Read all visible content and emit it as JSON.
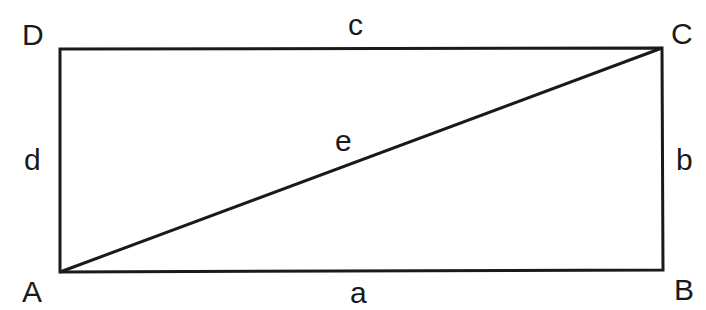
{
  "diagram": {
    "vertices": [
      {
        "id": "A",
        "label": "A",
        "x": 60,
        "y": 272
      },
      {
        "id": "B",
        "label": "B",
        "x": 663,
        "y": 270
      },
      {
        "id": "C",
        "label": "C",
        "x": 662,
        "y": 48
      },
      {
        "id": "D",
        "label": "D",
        "x": 60,
        "y": 49
      }
    ],
    "sides": [
      {
        "id": "a",
        "label": "a",
        "from": "A",
        "to": "B"
      },
      {
        "id": "b",
        "label": "b",
        "from": "B",
        "to": "C"
      },
      {
        "id": "c",
        "label": "c",
        "from": "D",
        "to": "C"
      },
      {
        "id": "d",
        "label": "d",
        "from": "A",
        "to": "D"
      },
      {
        "id": "e",
        "label": "e",
        "from": "A",
        "to": "C",
        "kind": "diagonal"
      }
    ],
    "line_color": "#1a1a1a"
  }
}
